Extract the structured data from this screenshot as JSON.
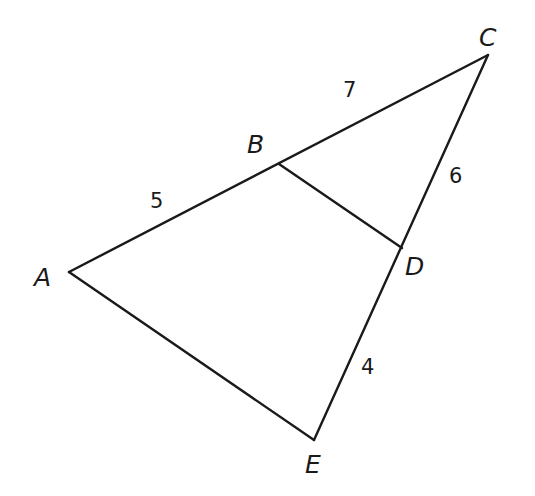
{
  "figure": {
    "vertices": {
      "A": {
        "label": "A",
        "x": 69,
        "y": 272
      },
      "B": {
        "label": "B",
        "x": 279,
        "y": 164
      },
      "C": {
        "label": "C",
        "x": 488,
        "y": 55
      },
      "D": {
        "label": "D",
        "x": 402,
        "y": 248
      },
      "E": {
        "label": "E",
        "x": 314,
        "y": 440
      }
    },
    "segments": [
      {
        "from": "A",
        "to": "C"
      },
      {
        "from": "C",
        "to": "E"
      },
      {
        "from": "E",
        "to": "A"
      },
      {
        "from": "B",
        "to": "D"
      }
    ],
    "lengths": {
      "AB": "5",
      "BC": "7",
      "CD": "6",
      "DE": "4"
    }
  }
}
